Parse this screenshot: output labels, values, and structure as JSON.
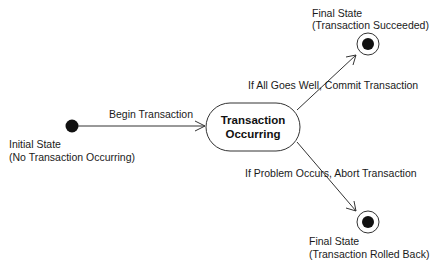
{
  "diagram": {
    "type": "uml-state-diagram",
    "colors": {
      "background": "#ffffff",
      "line": "#333333",
      "node_fill": "#111111",
      "text": "#1a1a1a"
    },
    "nodes": {
      "initial": {
        "kind": "initial-state",
        "label_line1": "Initial State",
        "label_line2": "(No Transaction Occurring)"
      },
      "occurring": {
        "kind": "state",
        "label_line1": "Transaction",
        "label_line2": "Occurring"
      },
      "succeeded": {
        "kind": "final-state",
        "label_line1": "Final State",
        "label_line2": "(Transaction Succeeded)"
      },
      "rolled_back": {
        "kind": "final-state",
        "label_line1": "Final State",
        "label_line2": "(Transaction Rolled Back)"
      }
    },
    "edges": {
      "begin": {
        "from": "initial",
        "to": "occurring",
        "label": "Begin Transaction"
      },
      "commit": {
        "from": "occurring",
        "to": "succeeded",
        "label": "If All Goes Well, Commit Transaction"
      },
      "abort": {
        "from": "occurring",
        "to": "rolled_back",
        "label": "If Problem Occurs, Abort Transaction"
      }
    }
  }
}
